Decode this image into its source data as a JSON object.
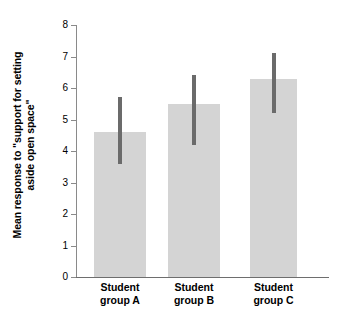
{
  "chart_data": {
    "type": "bar",
    "title": "",
    "xlabel": "",
    "ylabel": "Mean response to \"support for setting aside open space\"",
    "ylabel_line1": "Mean response to \"support for setting",
    "ylabel_line2": "aside open space\"",
    "categories": [
      "Student group A",
      "Student group B",
      "Student group C"
    ],
    "category_lines": [
      [
        "Student",
        "group A"
      ],
      [
        "Student",
        "group B"
      ],
      [
        "Student",
        "group C"
      ]
    ],
    "values": [
      4.6,
      5.5,
      6.3
    ],
    "error_high": [
      5.7,
      6.4,
      7.1
    ],
    "error_low": [
      3.6,
      4.2,
      5.2
    ],
    "ylim": [
      0,
      8
    ],
    "yticks": [
      0,
      1,
      2,
      3,
      4,
      5,
      6,
      7,
      8
    ],
    "ytick_labels": [
      "0",
      "1",
      "2",
      "3",
      "4",
      "5",
      "6",
      "7",
      "8"
    ],
    "grid": false,
    "legend": false,
    "bar_color": "#d4d4d4",
    "error_color": "#6b6b6b",
    "axis_color": "#8a8a8a",
    "background": "#ffffff"
  }
}
